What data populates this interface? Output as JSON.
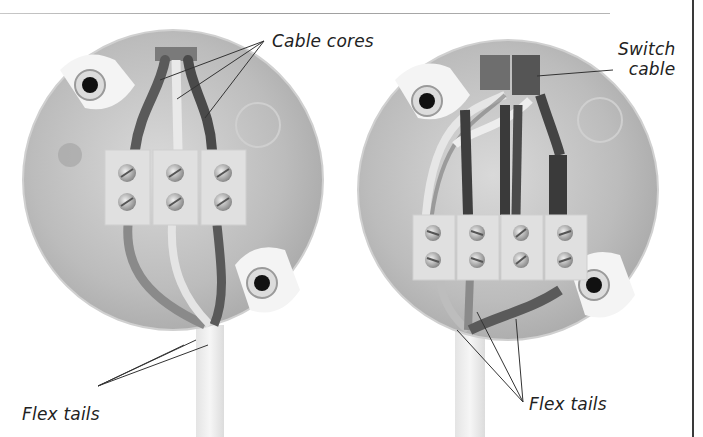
{
  "figure": {
    "panels": [
      {
        "id": "left",
        "description": "Ceiling rose with single cable, three-terminal block",
        "terminal_columns": 3,
        "screws_per_column": 2
      },
      {
        "id": "right",
        "description": "Ceiling rose with switch cable, four-terminal block",
        "terminal_columns": 4,
        "screws_per_column": 2
      }
    ],
    "labels": {
      "cable_cores": "Cable cores",
      "switch_cable_line1": "Switch",
      "switch_cable_line2": "cable",
      "flex_tails_left": "Flex tails",
      "flex_tails_right": "Flex tails"
    },
    "colors": {
      "background": "#ffffff",
      "text": "#222222",
      "leader_line": "#333333",
      "rose_body": "#bdbdbd",
      "rose_highlight": "#e6e6e6",
      "dark_core": "#4a4a4a",
      "light_core": "#e8e8e8",
      "terminal_block": "#dcdcdc",
      "right_rule": "#3a3a3a"
    }
  }
}
